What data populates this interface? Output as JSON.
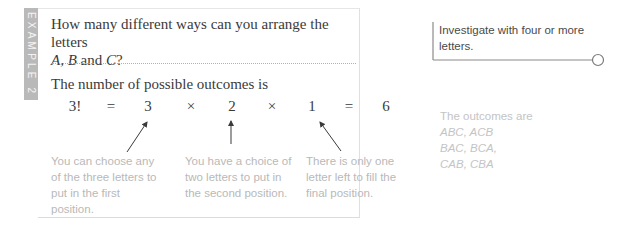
{
  "example_tab": {
    "label": "EXAMPLE 2",
    "color": "#b9b9b9"
  },
  "question": {
    "line1": "How many different ways can you arrange the letters",
    "line2_pre": "A",
    "line2_mid1": ", ",
    "line2_b": "B",
    "line2_mid2": " and ",
    "line2_c": "C",
    "line2_end": "?"
  },
  "lead": "The number of possible outcomes is",
  "equation": [
    "3!",
    "=",
    "3",
    "×",
    "2",
    "×",
    "1",
    "=",
    "6"
  ],
  "explanations": [
    "You can choose any of the three letters to put in the first position.",
    "You have a choice of two letters to put in the second position.",
    "There is only one letter left to fill the final position."
  ],
  "side_note": "Investigate with four or more letters.",
  "outcomes": {
    "intro": "The outcomes are",
    "lines": [
      "ABC, ACB",
      "BAC, BCA,",
      "CAB, CBA"
    ]
  }
}
